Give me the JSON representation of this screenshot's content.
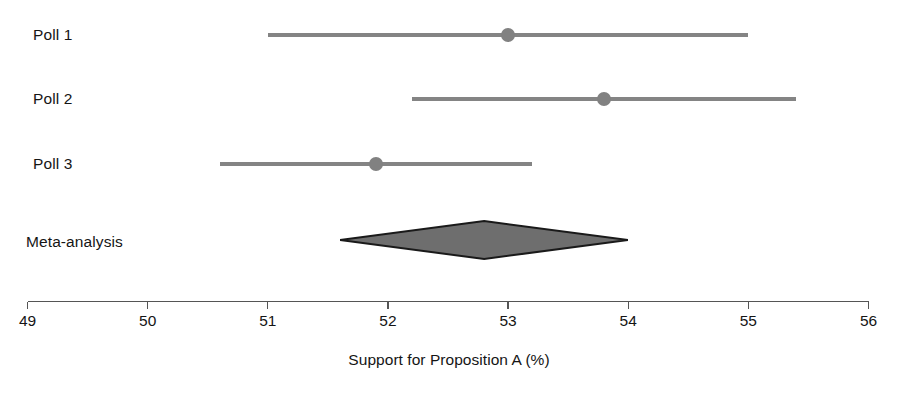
{
  "chart_data": {
    "type": "forest",
    "title": "",
    "xlabel": "Support for Proposition A (%)",
    "ylabel": "",
    "xlim": [
      49,
      56
    ],
    "xticks": [
      49,
      50,
      51,
      52,
      53,
      54,
      55,
      56
    ],
    "xtick_labels": [
      "49",
      "50",
      "51",
      "52",
      "53",
      "54",
      "55",
      "56"
    ],
    "grid": false,
    "legend": "none",
    "marker_color": "#818181",
    "line_color": "#848484",
    "diamond_fill": "#6e6e6e",
    "diamond_stroke": "#1a1a1a",
    "axis_color": "#555555",
    "studies": [
      {
        "label": "Poll 1",
        "estimate": 53.0,
        "ci_low": 51.0,
        "ci_high": 55.0,
        "row": 1
      },
      {
        "label": "Poll 2",
        "estimate": 53.8,
        "ci_low": 52.2,
        "ci_high": 55.4,
        "row": 2
      },
      {
        "label": "Poll 3",
        "estimate": 51.9,
        "ci_low": 50.6,
        "ci_high": 53.2,
        "row": 3
      }
    ],
    "summary": {
      "label": "Meta-analysis",
      "estimate": 52.8,
      "ci_low": 51.6,
      "ci_high": 54.0
    }
  },
  "caption": {
    "partial_text": ""
  }
}
